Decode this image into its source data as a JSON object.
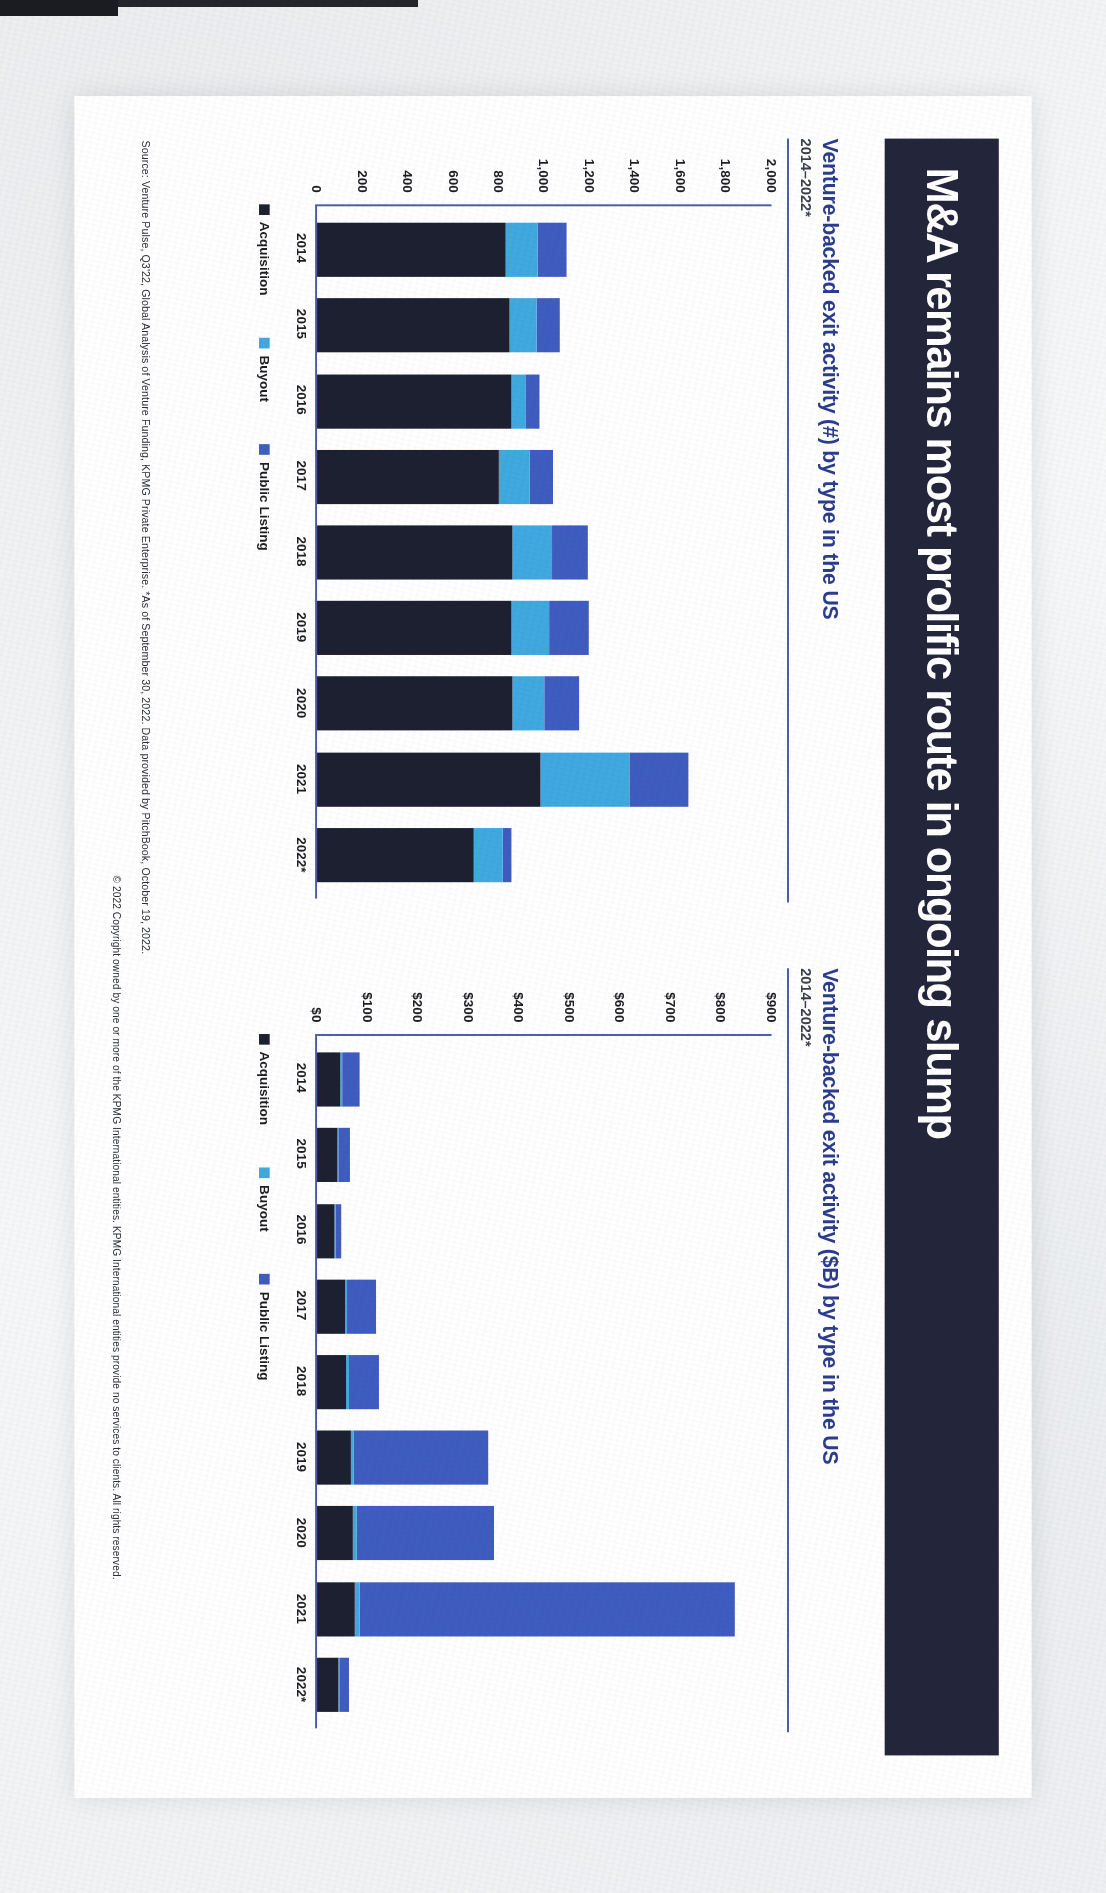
{
  "slide": {
    "title": "M&A remains most prolific route in ongoing slump",
    "title_bg": "#23263b",
    "accent": "#2b3c8f"
  },
  "colors": {
    "acquisition": "#1c2030",
    "buyout": "#3fa9e0",
    "public_listing": "#3f5cc0",
    "axis": "#4b5ba6"
  },
  "legend": {
    "acquisition": "Acquisition",
    "buyout": "Buyout",
    "public_listing": "Public Listing"
  },
  "footer": {
    "source": "Source: Venture Pulse, Q3'22, Global Analysis of Venture Funding, KPMG Private Enterprise. *As of September 30, 2022. Data provided by PitchBook, October 19, 2022.",
    "copyright": "© 2022 Copyright owned by one or more of the KPMG International entities. KPMG International entities provide no services to clients. All rights reserved."
  },
  "chart_data": [
    {
      "id": "count",
      "type": "bar",
      "stacked": true,
      "title": "Venture-backed exit activity (#) by type in the US",
      "subtitle": "2014–2022*",
      "xlabel": "",
      "ylabel": "",
      "ylim": [
        0,
        2000
      ],
      "grid": false,
      "legend_position": "bottom",
      "yticks": [
        "0",
        "200",
        "400",
        "600",
        "800",
        "1,000",
        "1,200",
        "1,400",
        "1,600",
        "1,800",
        "2,000"
      ],
      "ytick_values": [
        0,
        200,
        400,
        600,
        800,
        1000,
        1200,
        1400,
        1600,
        1800,
        2000
      ],
      "categories": [
        "2014",
        "2015",
        "2016",
        "2017",
        "2018",
        "2019",
        "2020",
        "2021",
        "2022*"
      ],
      "series": [
        {
          "name": "Acquisition",
          "color": "#1c2030",
          "values": [
            830,
            845,
            855,
            800,
            860,
            855,
            860,
            985,
            690
          ]
        },
        {
          "name": "Buyout",
          "color": "#3fa9e0",
          "values": [
            140,
            120,
            65,
            135,
            175,
            165,
            140,
            390,
            125
          ]
        },
        {
          "name": "Public Listing",
          "color": "#3f5cc0",
          "values": [
            130,
            105,
            60,
            105,
            155,
            175,
            155,
            260,
            40
          ]
        }
      ],
      "totals": [
        1100,
        1070,
        980,
        1040,
        1190,
        1195,
        1155,
        1635,
        855
      ]
    },
    {
      "id": "value",
      "type": "bar",
      "stacked": true,
      "title": "Venture-backed exit activity ($B) by type in the US",
      "subtitle": "2014–2022*",
      "xlabel": "",
      "ylabel": "",
      "ylim": [
        0,
        900
      ],
      "grid": false,
      "legend_position": "bottom",
      "yticks": [
        "$0",
        "$100",
        "$200",
        "$300",
        "$400",
        "$500",
        "$600",
        "$700",
        "$800",
        "$900"
      ],
      "ytick_values": [
        0,
        100,
        200,
        300,
        400,
        500,
        600,
        700,
        800,
        900
      ],
      "categories": [
        "2014",
        "2015",
        "2016",
        "2017",
        "2018",
        "2019",
        "2020",
        "2021",
        "2022*"
      ],
      "series": [
        {
          "name": "Acquisition",
          "color": "#1c2030",
          "values": [
            46,
            40,
            34,
            55,
            58,
            67,
            70,
            74,
            42
          ]
        },
        {
          "name": "Buyout",
          "color": "#3fa9e0",
          "values": [
            3,
            3,
            2,
            4,
            5,
            5,
            8,
            10,
            3
          ]
        },
        {
          "name": "Public Listing",
          "color": "#3f5cc0",
          "values": [
            36,
            22,
            11,
            57,
            60,
            267,
            272,
            744,
            18
          ]
        }
      ],
      "totals": [
        85,
        65,
        47,
        116,
        123,
        339,
        350,
        828,
        63
      ]
    }
  ]
}
